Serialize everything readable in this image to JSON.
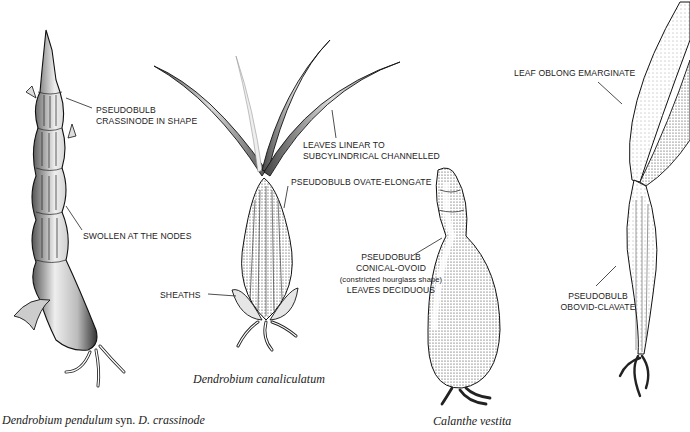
{
  "figure": {
    "background": "#ffffff",
    "ink": "#1a1a1a"
  },
  "specimens": [
    {
      "id": "dendrobium-pendulum",
      "caption_genus": "Dendrobium pendulum",
      "caption_syn": "syn.",
      "caption_alt": "D. crassinode",
      "labels": [
        "PSEUDOBULB",
        "CRASSINODE IN SHAPE",
        "SWOLLEN AT THE NODES"
      ]
    },
    {
      "id": "dendrobium-canaliculatum",
      "caption": "Dendrobium canaliculatum",
      "labels": [
        "LEAVES LINEAR TO",
        "SUBCYLINDRICAL CHANNELLED",
        "PSEUDOBULB OVATE-ELONGATE",
        "SHEATHS"
      ]
    },
    {
      "id": "calanthe-vestita",
      "caption": "Calanthe vestita",
      "labels": [
        "PSEUDOBULB",
        "CONICAL-OVOID",
        "(constricted hourglass shape)",
        "LEAVES DECIDUOUS"
      ]
    },
    {
      "id": "unnamed-clavate",
      "labels": [
        "LEAF OBLONG EMARGINATE",
        "PSEUDOBULB",
        "OBOVID-CLAVATE"
      ]
    }
  ]
}
